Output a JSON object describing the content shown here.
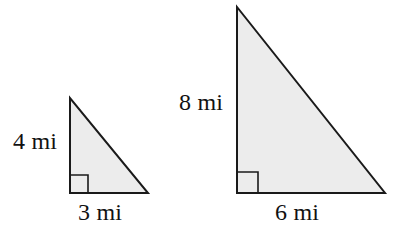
{
  "figure": {
    "kind": "geometry-diagram",
    "background_color": "#ffffff",
    "fill_color": "#ececec",
    "stroke_color": "#1a1a1a",
    "stroke_width": 2,
    "unit": "mi",
    "shapes": [
      {
        "id": "small-triangle",
        "name": "small-right-triangle",
        "type": "right-triangle",
        "vertices": [
          {
            "name": "apex",
            "x": 70,
            "y": 98
          },
          {
            "name": "right-angle",
            "x": 70,
            "y": 193
          },
          {
            "name": "base-right",
            "x": 148,
            "y": 193
          }
        ],
        "right_angle_marker": {
          "x": 70,
          "y": 175,
          "size": 18
        },
        "legs": {
          "vertical": {
            "label": "4 mi",
            "value": 4,
            "unit": "mi"
          },
          "horizontal": {
            "label": "3 mi",
            "value": 3,
            "unit": "mi"
          }
        }
      },
      {
        "id": "large-triangle",
        "name": "large-right-triangle",
        "type": "right-triangle",
        "vertices": [
          {
            "name": "apex",
            "x": 237,
            "y": 7
          },
          {
            "name": "right-angle",
            "x": 237,
            "y": 193
          },
          {
            "name": "base-right",
            "x": 385,
            "y": 193
          }
        ],
        "right_angle_marker": {
          "x": 237,
          "y": 172,
          "size": 21
        },
        "legs": {
          "vertical": {
            "label": "8 mi",
            "value": 8,
            "unit": "mi"
          },
          "horizontal": {
            "label": "6 mi",
            "value": 6,
            "unit": "mi"
          }
        }
      }
    ]
  },
  "labels": {
    "small_height": "4 mi",
    "small_base": "3 mi",
    "large_height": "8 mi",
    "large_base": "6 mi"
  }
}
